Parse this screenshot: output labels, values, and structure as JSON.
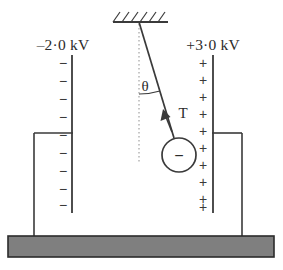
{
  "figure": {
    "canvas": {
      "width": 283,
      "height": 270,
      "background": "#ffffff"
    }
  },
  "colors": {
    "stroke": "#3a3a3a",
    "text": "#2b2b2b",
    "base_fill": "#7f7f7f",
    "base_stroke": "#2b2b2b",
    "dotted_line": "#9a9a9a"
  },
  "labels": {
    "left_plate_voltage": "–2·0 kV",
    "right_plate_voltage": "+3·0 kV",
    "angle": "θ",
    "tension": "T",
    "bob_charge_sign": "−"
  },
  "left_plate": {
    "name": "negative-plate",
    "voltage_text": "–2·0 kV",
    "polarity": "negative",
    "sign_glyph": "−",
    "sign_count": 9,
    "x": 72,
    "y_top": 55,
    "y_bottom": 213,
    "sign_x": 63,
    "sign_y_start": 64,
    "sign_spacing": 18.2
  },
  "right_plate": {
    "name": "positive-plate",
    "voltage_text": "+3·0 kV",
    "polarity": "positive",
    "sign_glyph": "+",
    "sign_count": 10,
    "x": 213,
    "y_top": 55,
    "y_bottom": 213,
    "sign_x": 203,
    "sign_y_start": 63,
    "sign_spacing": 16.6
  },
  "ceiling": {
    "name": "ceiling-support",
    "x_start": 113,
    "x_end": 168,
    "y": 22,
    "hatch_count": 6,
    "hatch_length": 12,
    "hatch_angle_deg": 45
  },
  "pendulum": {
    "pivot_x": 139,
    "pivot_y": 22,
    "bob_center_x": 179,
    "bob_center_y": 155,
    "bob_radius": 17,
    "string_angle_deg": 17,
    "vertical_dotted_line": {
      "x": 139,
      "y_top": 24,
      "y_bottom": 162
    },
    "angle_arc": {
      "center_x": 139,
      "center_y": 22,
      "radius": 72
    },
    "angle_label_x": 144,
    "angle_label_y": 90,
    "tension_arrow": {
      "tip_x": 163,
      "tip_y": 119,
      "tail_x": 172,
      "tail_y": 141
    },
    "tension_label_x": 180,
    "tension_label_y": 118
  },
  "supports": {
    "left": {
      "name": "left-support-bracket",
      "arm_y": 133,
      "arm_x_start": 34,
      "arm_x_end": 72,
      "post_x": 34,
      "post_y_bottom": 236
    },
    "right": {
      "name": "right-support-bracket",
      "arm_y": 133,
      "arm_x_start": 213,
      "arm_x_end": 242,
      "post_x": 242,
      "post_y_bottom": 236
    }
  },
  "base": {
    "name": "base-slab",
    "x": 8,
    "y": 236,
    "width": 266,
    "height": 21,
    "fill": "#7f7f7f",
    "stroke": "#2b2b2b"
  }
}
